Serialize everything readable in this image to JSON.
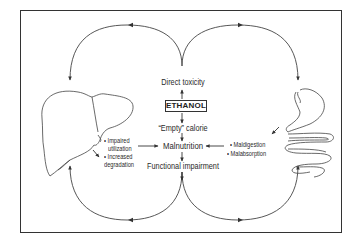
{
  "diagram": {
    "center": {
      "top_effect": "Direct toxicity",
      "source": "ETHANOL",
      "calorie": "“Empty” calorie",
      "core": "Malnutrition",
      "outcome": "Functional impairment"
    },
    "liver": {
      "organ": "liver",
      "effects": [
        "• Impaired",
        "utilization",
        "• Increased",
        "degradation"
      ]
    },
    "gut": {
      "organ": "stomach-and-intestine",
      "effects": [
        "• Maldigestion",
        "• Malabsorption"
      ]
    },
    "colors": {
      "line": "#333333",
      "background": "#ffffff"
    }
  }
}
